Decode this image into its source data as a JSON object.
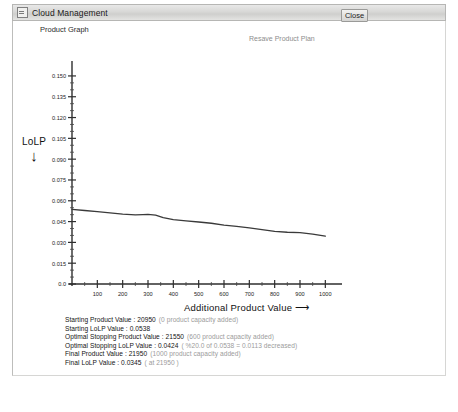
{
  "window": {
    "title": "Cloud Management",
    "icon": "window-app-icon"
  },
  "toolbar": {
    "close_label": "Close"
  },
  "headings": {
    "graph_title": "Product Graph",
    "plan_label": "Resave Product Plan"
  },
  "axes": {
    "y_caption": "LoLP",
    "y_arrow": "↓",
    "x_caption": "Additional Product Value ⟶"
  },
  "stats": [
    {
      "label": "Starting Product Value : 20950",
      "note": "(0 product capacity added)"
    },
    {
      "label": "Starting LoLP Value : 0.0538",
      "note": ""
    },
    {
      "label": "Optimal Stopping Product Value : 21550",
      "note": "(600 product capacity added)"
    },
    {
      "label": "Optimal Stopping LoLP Value : 0.0424",
      "note": "( %20.0 of 0.0538 = 0.0113 decreased)"
    },
    {
      "label": "Final Product Value : 21950",
      "note": "(1000 product capacity added)"
    },
    {
      "label": "Final LoLP Value : 0.0345",
      "note": "( at 21950 )"
    }
  ],
  "chart_data": {
    "type": "line",
    "title": "Product Graph",
    "xlabel": "Additional Product Value ⟶",
    "ylabel": "LoLP",
    "xlim": [
      0,
      1050
    ],
    "ylim": [
      0.0,
      0.155
    ],
    "grid": false,
    "legend": "none",
    "xticks": [
      100,
      200,
      300,
      400,
      500,
      600,
      700,
      800,
      900,
      1000
    ],
    "yticks": [
      0.0,
      0.015,
      0.03,
      0.045,
      0.06,
      0.075,
      0.09,
      0.105,
      0.12,
      0.135,
      0.15
    ],
    "ytick_labels": [
      "0.0",
      "0.015",
      "0.030",
      "0.045",
      "0.060",
      "0.075",
      "0.090",
      "0.105",
      "0.120",
      "0.135",
      "0.150"
    ],
    "xtick_labels": [
      "100",
      "200",
      "300",
      "400",
      "500",
      "600",
      "700",
      "800",
      "900",
      "1000"
    ],
    "series": [
      {
        "name": "LoLP",
        "color": "#3a3a3a",
        "x": [
          0,
          50,
          100,
          150,
          200,
          250,
          280,
          300,
          330,
          360,
          400,
          450,
          500,
          550,
          600,
          650,
          700,
          750,
          800,
          850,
          900,
          950,
          1000
        ],
        "y": [
          0.0538,
          0.053,
          0.0522,
          0.0513,
          0.0504,
          0.0498,
          0.05,
          0.0502,
          0.0497,
          0.0478,
          0.0464,
          0.0455,
          0.0447,
          0.0438,
          0.0424,
          0.0415,
          0.0404,
          0.0392,
          0.038,
          0.0373,
          0.037,
          0.036,
          0.0345
        ]
      }
    ]
  }
}
